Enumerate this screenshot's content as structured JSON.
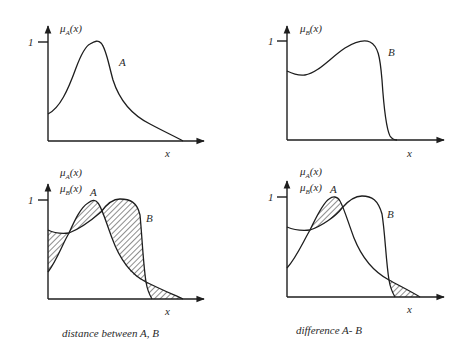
{
  "figure": {
    "panels": [
      {
        "id": "top-left",
        "y_labels": [
          "μA(x)"
        ],
        "tick_label": "1",
        "x_label": "x",
        "curve_labels": [
          "A"
        ],
        "caption": ""
      },
      {
        "id": "top-right",
        "y_labels": [
          "μB(x)"
        ],
        "tick_label": "1",
        "x_label": "x",
        "curve_labels": [
          "B"
        ],
        "caption": ""
      },
      {
        "id": "bottom-left",
        "y_labels": [
          "μA(x)",
          "μB(x)"
        ],
        "tick_label": "1",
        "x_label": "x",
        "curve_labels": [
          "A",
          "B"
        ],
        "caption": "distance between A, B",
        "shaded": "all regions between A and B (|A − B|)"
      },
      {
        "id": "bottom-right",
        "y_labels": [
          "μA(x)",
          "μB(x)"
        ],
        "tick_label": "1",
        "x_label": "x",
        "curve_labels": [
          "A",
          "B"
        ],
        "caption": "difference A- B",
        "shaded": "regions where A > B"
      }
    ],
    "labels": {
      "mu_a": "μ",
      "mu_a_sub": "A",
      "mu_b": "μ",
      "mu_b_sub": "B",
      "of_x": "(x)",
      "one": "1",
      "x": "x",
      "a": "A",
      "b": "B",
      "caption_distance": "distance between A, B",
      "caption_difference": "difference A- B"
    },
    "colors": {
      "line": "#1e1e1e",
      "text": "#2a2a2a",
      "background": "#ffffff"
    }
  }
}
